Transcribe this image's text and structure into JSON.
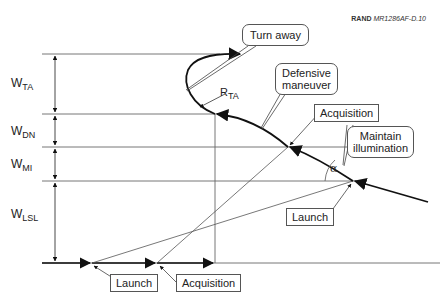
{
  "credit": {
    "org": "RAND",
    "doc_id": "MR1286AF-D.10"
  },
  "dimensions": [
    {
      "id": "ta",
      "base": "W",
      "sub": "TA"
    },
    {
      "id": "dn",
      "base": "W",
      "sub": "DN"
    },
    {
      "id": "mi",
      "base": "W",
      "sub": "MI"
    },
    {
      "id": "lsl",
      "base": "W",
      "sub": "LSL"
    }
  ],
  "radius_label": {
    "base": "R",
    "sub": "TA"
  },
  "angle_label": "α",
  "callouts": {
    "turn_away": "Turn away",
    "defensive_maneuver_line1": "Defensive",
    "defensive_maneuver_line2": "maneuver",
    "acquisition_air": "Acquisition",
    "maintain_illumination_line1": "Maintain",
    "maintain_illumination_line2": "illumination",
    "launch_air": "Launch",
    "launch_ground": "Launch",
    "acquisition_ground": "Acquisition"
  },
  "colors": {
    "line": "#555555",
    "trajectory": "#111111",
    "text": "#222222"
  }
}
